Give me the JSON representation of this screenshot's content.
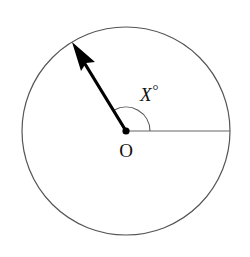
{
  "diagram": {
    "type": "circle-angle-figure",
    "circle": {
      "cx": 126,
      "cy": 131,
      "r": 104,
      "stroke": "#555555"
    },
    "center_point": {
      "label": "O",
      "cx": 126,
      "cy": 131
    },
    "radius_line": {
      "direction": "horizontal-right",
      "color": "#666666"
    },
    "arrow": {
      "tip_x": 72,
      "tip_y": 42,
      "color": "#000000",
      "angle_degrees_from_horizontal": 120
    },
    "angle_label": {
      "variable": "X",
      "unit_symbol": "°"
    }
  }
}
